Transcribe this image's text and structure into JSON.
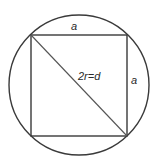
{
  "diagram": {
    "labels": {
      "top_side": "a",
      "right_side": "a",
      "diagonal": "2r=d"
    },
    "colors": {
      "stroke": "#3a3a3a",
      "diagonal": "#555555",
      "background": "#ffffff"
    }
  }
}
